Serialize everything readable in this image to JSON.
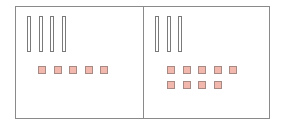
{
  "diagram": {
    "type": "base-ten-blocks",
    "panels": [
      {
        "name": "left",
        "tens_rods": 4,
        "ones_units": 5,
        "value": 45
      },
      {
        "name": "right",
        "tens_rods": 3,
        "ones_units": 9,
        "value": 39
      }
    ],
    "colors": {
      "border": "#8a8a8a",
      "rod_outline": "#7a7a7a",
      "unit_fill": "#f2b8ae",
      "unit_outline": "#a88a84"
    }
  }
}
